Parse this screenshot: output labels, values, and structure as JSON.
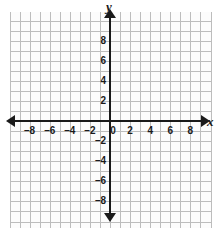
{
  "chart_data": {
    "type": "scatter",
    "title": "",
    "subtitle": "",
    "xlabel": "x",
    "ylabel": "y",
    "xlim": [
      -10,
      10
    ],
    "ylim": [
      -10,
      10
    ],
    "grid": true,
    "grid_step": 1,
    "tick_step": 2,
    "legend": "none",
    "series": [],
    "annotations": [],
    "x_ticks": [
      {
        "value": -8,
        "label": "–8"
      },
      {
        "value": -6,
        "label": "–6"
      },
      {
        "value": -4,
        "label": "–4"
      },
      {
        "value": -2,
        "label": "–2"
      },
      {
        "value": 2,
        "label": "2"
      },
      {
        "value": 4,
        "label": "4"
      },
      {
        "value": 6,
        "label": "6"
      },
      {
        "value": 8,
        "label": "8"
      }
    ],
    "y_ticks": [
      {
        "value": 8,
        "label": "8"
      },
      {
        "value": 6,
        "label": "6"
      },
      {
        "value": 4,
        "label": "4"
      },
      {
        "value": 2,
        "label": "2"
      },
      {
        "value": -2,
        "label": "–2"
      },
      {
        "value": -4,
        "label": "–4"
      },
      {
        "value": -6,
        "label": "–6"
      },
      {
        "value": -8,
        "label": "–8"
      }
    ],
    "origin_label": "0",
    "colors": {
      "background": "#ffffff",
      "plot_background": "#fcfcfc",
      "gridline": "#bdbdbd",
      "axis": "#1a1a1a",
      "label": "#1a1a1a"
    }
  },
  "axis_names": {
    "x": "x",
    "y": "y"
  }
}
